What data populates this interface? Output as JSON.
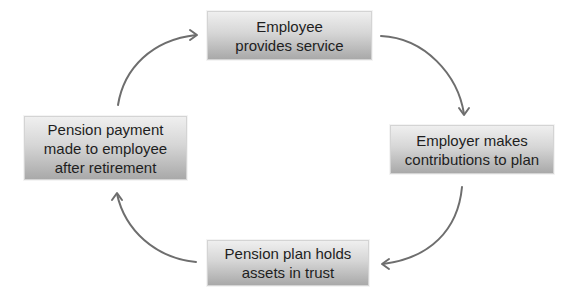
{
  "diagram": {
    "type": "cycle",
    "nodes": [
      {
        "id": "top",
        "label": "Employee\nprovides service"
      },
      {
        "id": "right",
        "label": "Employer makes\ncontributions to plan"
      },
      {
        "id": "bottom",
        "label": "Pension plan holds\nassets in trust"
      },
      {
        "id": "left",
        "label": "Pension payment\nmade to employee\nafter retirement"
      }
    ],
    "edges": [
      {
        "from": "top",
        "to": "right",
        "direction": "clockwise"
      },
      {
        "from": "right",
        "to": "bottom",
        "direction": "clockwise"
      },
      {
        "from": "bottom",
        "to": "left",
        "direction": "clockwise"
      },
      {
        "from": "left",
        "to": "top",
        "direction": "clockwise"
      }
    ],
    "colors": {
      "box_gradient_top": "#efefef",
      "box_gradient_bottom": "#a9a9a9",
      "box_border": "#d4d4d4",
      "arrow": "#6e6e6e",
      "text": "#1e1e1e",
      "background": "#ffffff"
    }
  }
}
